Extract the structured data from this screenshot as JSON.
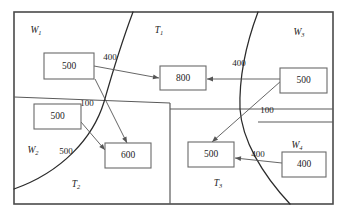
{
  "figure": {
    "frame": {
      "x": 14,
      "y": 12,
      "width": 319,
      "height": 192
    },
    "colors": {
      "frame_stroke": "#4a4a4a",
      "divider_stroke": "#5a5a5a",
      "curve_stroke": "#2b2b2b",
      "flow_stroke": "#555555",
      "box_stroke": "#6a6a6a",
      "background": "#ffffff",
      "text": "#1c1c1c"
    }
  },
  "regions": [
    {
      "id": "w1",
      "base": "W",
      "sub": "1",
      "label": "W1",
      "x": 36,
      "y": 31
    },
    {
      "id": "t1",
      "base": "T",
      "sub": "1",
      "label": "T1",
      "x": 159,
      "y": 31
    },
    {
      "id": "w3",
      "base": "W",
      "sub": "3",
      "label": "W3",
      "x": 299,
      "y": 33
    },
    {
      "id": "w2",
      "base": "W",
      "sub": "2",
      "label": "W2",
      "x": 33,
      "y": 151
    },
    {
      "id": "t2",
      "base": "T",
      "sub": "2",
      "label": "T2",
      "x": 76,
      "y": 185
    },
    {
      "id": "t3",
      "base": "T",
      "sub": "3",
      "label": "T3",
      "x": 218,
      "y": 184
    },
    {
      "id": "w4",
      "base": "W",
      "sub": "4",
      "label": "W4",
      "x": 297,
      "y": 146
    }
  ],
  "nodes": [
    {
      "id": "n-w1-supply",
      "value": "500",
      "x": 44,
      "y": 53,
      "width": 50,
      "height": 26
    },
    {
      "id": "n-t1-demand",
      "value": "800",
      "x": 160,
      "y": 66,
      "width": 46,
      "height": 24
    },
    {
      "id": "n-w3-supply",
      "value": "500",
      "x": 280,
      "y": 68,
      "width": 47,
      "height": 25
    },
    {
      "id": "n-w2-supply",
      "value": "500",
      "x": 34,
      "y": 104,
      "width": 47,
      "height": 25
    },
    {
      "id": "n-t2-demand",
      "value": "600",
      "x": 105,
      "y": 143,
      "width": 46,
      "height": 25
    },
    {
      "id": "n-t3-demand",
      "value": "500",
      "x": 188,
      "y": 142,
      "width": 46,
      "height": 25
    },
    {
      "id": "n-w4-supply",
      "value": "400",
      "x": 282,
      "y": 152,
      "width": 44,
      "height": 25
    }
  ],
  "flows": [
    {
      "id": "flow-w1-to-t1",
      "label": "400",
      "label_x": 110,
      "label_y": 58,
      "from": "n-w1-supply",
      "to": "n-t1-demand",
      "path": "M 94 66 L 159 78",
      "arrow_x": 159,
      "arrow_y": 78,
      "arrow_angle": 10.5
    },
    {
      "id": "flow-w1-to-t2",
      "label": "100",
      "label_x": 87,
      "label_y": 104,
      "from": "n-w1-supply",
      "to": "n-t2-demand",
      "path": "M 95 79 L 127 143",
      "arrow_x": 127,
      "arrow_y": 143,
      "arrow_angle": 63.4
    },
    {
      "id": "flow-w2-to-t2",
      "label": "500",
      "label_x": 66,
      "label_y": 152,
      "from": "n-w2-supply",
      "to": "n-t2-demand",
      "path": "M 81 122 L 105 150",
      "arrow_x": 105,
      "arrow_y": 150,
      "arrow_angle": 49.4
    },
    {
      "id": "flow-w3-to-t1",
      "label": "400",
      "label_x": 239,
      "label_y": 64,
      "from": "n-w3-supply",
      "to": "n-t1-demand",
      "path": "M 280 79 L 207 79",
      "arrow_x": 207,
      "arrow_y": 79,
      "arrow_angle": 180
    },
    {
      "id": "flow-w3-to-t3",
      "label": "100",
      "label_x": 267,
      "label_y": 111,
      "from": "n-w3-supply",
      "to": "n-t3-demand",
      "path": "M 281 81 L 212 142",
      "arrow_x": 212,
      "arrow_y": 142,
      "arrow_angle": 138.5
    },
    {
      "id": "flow-w4-to-t3",
      "label": "400",
      "label_x": 258,
      "label_y": 155,
      "from": "n-w4-supply",
      "to": "n-t3-demand",
      "path": "M 282 163 L 235 158",
      "arrow_x": 235,
      "arrow_y": 158,
      "arrow_angle": 186
    }
  ],
  "dividers": [
    {
      "id": "divider-left-horizontal",
      "path": "M 14 97 L 170 103"
    },
    {
      "id": "divider-right-horizontal",
      "path": "M 170 109 L 333 109"
    },
    {
      "id": "divider-lower-vertical",
      "path": "M 170 103 L 170 204"
    },
    {
      "id": "divider-w4-horizontal",
      "path": "M 258 122 L 333 122"
    }
  ],
  "boundaries": [
    {
      "id": "curve-left-t1-t2",
      "path": "M 133 12 C 121 44, 112 74, 104 102 C 93 138, 62 172, 14 189"
    },
    {
      "id": "curve-right-t1-t3",
      "path": "M 258 12 C 246 44, 239 78, 240 109 C 242 140, 262 174, 290 204"
    }
  ]
}
